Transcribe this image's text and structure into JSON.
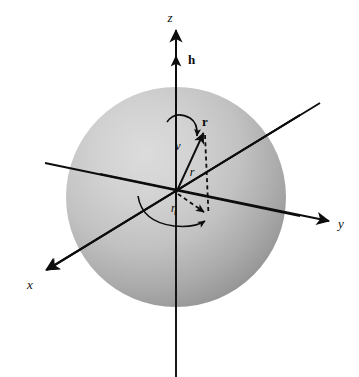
{
  "figure": {
    "background_color": "#ffffff",
    "ink_color": "#0d0d0d",
    "sphere": {
      "name": "shaded-sphere",
      "center_x": 176,
      "center_y": 197,
      "radius": 110,
      "highlight_color": "#d8d8d8",
      "mid_color": "#b8b8b8",
      "shadow_color": "#8e8e8e"
    },
    "origin": {
      "x": 176,
      "y": 193
    },
    "axes": [
      {
        "id": "z-axis",
        "label": "z",
        "label_style": "italic",
        "label_x": 176,
        "label_y": 20,
        "from": {
          "x": 176,
          "y": 377
        },
        "to": {
          "x": 176,
          "y": 28
        },
        "arrow": "up"
      },
      {
        "id": "y-axis",
        "label": "y",
        "label_style": "italic",
        "label_x": 343,
        "label_y": 227,
        "from": {
          "x": 45,
          "y": 163
        },
        "to": {
          "x": 330,
          "y": 222
        },
        "arrow": "right"
      },
      {
        "id": "x-axis",
        "label": "x",
        "label_style": "italic",
        "label_x": 30,
        "label_y": 288,
        "from": {
          "x": 320,
          "y": 103
        },
        "to": {
          "x": 43,
          "y": 272
        },
        "arrow": "down-left"
      }
    ],
    "vectors": [
      {
        "id": "h-vector",
        "label": "h",
        "label_style": "bold",
        "label_x": 187,
        "label_y": 64,
        "from": {
          "x": 176,
          "y": 90
        },
        "to": {
          "x": 176,
          "y": 55
        },
        "description": "angular momentum unit vector along z"
      },
      {
        "id": "r-vector",
        "label": "r",
        "label_style": "bold",
        "label_x": 207,
        "label_y": 127,
        "from": {
          "x": 176,
          "y": 193
        },
        "to": {
          "x": 204,
          "y": 131
        },
        "description": "position vector from origin to point on sphere"
      }
    ],
    "dashed": [
      {
        "id": "vertical-drop-line",
        "from": {
          "x": 205,
          "y": 133
        },
        "to": {
          "x": 208,
          "y": 215
        },
        "description": "projection of r onto equatorial plane"
      },
      {
        "id": "eta-projection-arrow",
        "from": {
          "x": 176,
          "y": 193
        },
        "to": {
          "x": 207,
          "y": 213
        },
        "description": "in-plane projection direction with arrowhead"
      }
    ],
    "angles": [
      {
        "id": "nu-angle",
        "label": "ν",
        "label_x": 179,
        "label_y": 150,
        "description": "polar angle nu measured from z-axis to r, curved arrow"
      },
      {
        "id": "eta-angle",
        "label": "η",
        "label_x": 174,
        "label_y": 211,
        "description": "azimuth angle eta in equatorial plane, curved arrow"
      }
    ],
    "lengths": [
      {
        "id": "r-magnitude",
        "label": "r",
        "label_x": 192,
        "label_y": 175,
        "description": "italic r denoting magnitude of position vector"
      }
    ]
  }
}
